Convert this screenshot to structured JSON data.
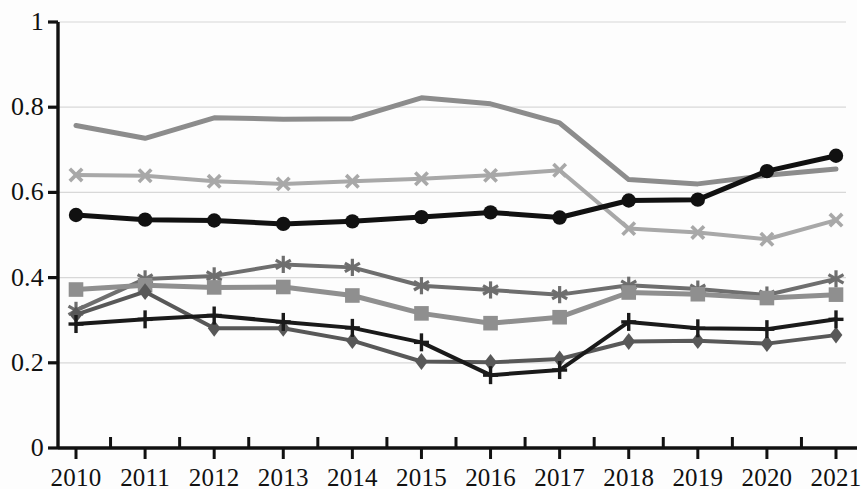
{
  "chart_data": {
    "type": "line",
    "title": "",
    "subtitle": "",
    "xlabel": "",
    "ylabel": "",
    "categories": [
      "2010",
      "2011",
      "2012",
      "2013",
      "2014",
      "2015",
      "2016",
      "2017",
      "2018",
      "2019",
      "2020",
      "2021"
    ],
    "x": [
      2010,
      2011,
      2012,
      2013,
      2014,
      2015,
      2016,
      2017,
      2018,
      2019,
      2020,
      2021
    ],
    "ylim": [
      0,
      1
    ],
    "xlim": [
      2010,
      2021
    ],
    "y_ticks": [
      "0",
      "0.2",
      "0.4",
      "0.6",
      "0.8",
      "1"
    ],
    "y_tick_values": [
      0,
      0.2,
      0.4,
      0.6,
      0.8,
      1
    ],
    "grid": "horizontal",
    "legend": "none",
    "series": [
      {
        "name": "series-1-gray-no-marker",
        "marker": "none",
        "color": "#8c8c8c",
        "width": 5,
        "values": [
          0.757,
          0.727,
          0.775,
          0.772,
          0.773,
          0.822,
          0.808,
          0.763,
          0.63,
          0.62,
          0.64,
          0.655
        ]
      },
      {
        "name": "series-2-x-marker",
        "marker": "x",
        "color": "#a8a8a8",
        "width": 4,
        "values": [
          0.641,
          0.639,
          0.626,
          0.62,
          0.626,
          0.632,
          0.64,
          0.652,
          0.515,
          0.506,
          0.49,
          0.535
        ]
      },
      {
        "name": "series-3-black-circle",
        "marker": "circle",
        "color": "#111111",
        "width": 5,
        "values": [
          0.547,
          0.536,
          0.534,
          0.526,
          0.532,
          0.542,
          0.553,
          0.541,
          0.581,
          0.583,
          0.65,
          0.686
        ]
      },
      {
        "name": "series-4-asterisk",
        "marker": "asterisk",
        "color": "#6e6e6e",
        "width": 4,
        "values": [
          0.323,
          0.397,
          0.404,
          0.431,
          0.424,
          0.381,
          0.371,
          0.36,
          0.382,
          0.373,
          0.359,
          0.397
        ]
      },
      {
        "name": "series-5-gray-square",
        "marker": "square",
        "color": "#8f8f8f",
        "width": 5,
        "values": [
          0.372,
          0.382,
          0.377,
          0.378,
          0.358,
          0.316,
          0.293,
          0.307,
          0.365,
          0.361,
          0.352,
          0.36
        ]
      },
      {
        "name": "series-6-diamond",
        "marker": "diamond",
        "color": "#585858",
        "width": 4,
        "values": [
          0.313,
          0.367,
          0.281,
          0.281,
          0.252,
          0.203,
          0.201,
          0.209,
          0.25,
          0.252,
          0.245,
          0.265
        ]
      },
      {
        "name": "series-7-black-plus",
        "marker": "plus",
        "color": "#1a1a1a",
        "width": 4,
        "values": [
          0.291,
          0.302,
          0.311,
          0.296,
          0.282,
          0.248,
          0.171,
          0.183,
          0.296,
          0.281,
          0.279,
          0.302
        ]
      }
    ]
  },
  "axes": {
    "y_axis_name": "value-axis",
    "x_axis_name": "year-axis",
    "axis_color": "#111111",
    "grid_color": "#d8d8d8"
  }
}
